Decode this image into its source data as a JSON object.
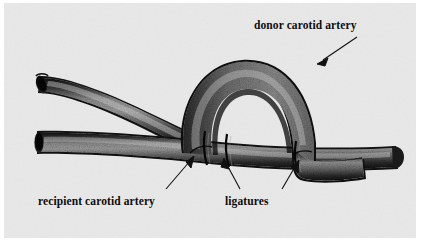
{
  "figure": {
    "kind": "anatomical-photograph",
    "background_color": "#e9e9e9",
    "border_color": "#ffffff",
    "vessel_dark": "#1d1d1d",
    "vessel_mid": "#555555",
    "vessel_light": "#a8a8a8"
  },
  "labels": {
    "donor": "donor carotid artery",
    "recipient": "recipient carotid artery",
    "ligatures": "ligatures"
  },
  "annotations": {
    "arrows": [
      {
        "name": "donor-arrow",
        "from_x": 357,
        "from_y": 36,
        "to_x": 316,
        "to_y": 64
      },
      {
        "name": "recipient-arrow",
        "from_x": 166,
        "from_y": 188,
        "to_x": 190,
        "to_y": 158
      },
      {
        "name": "ligature-arrow-left",
        "from_x": 240,
        "from_y": 188,
        "to_x": 224,
        "to_y": 158
      },
      {
        "name": "ligature-arrow-right",
        "from_x": 282,
        "from_y": 188,
        "to_x": 298,
        "to_y": 158
      }
    ]
  }
}
